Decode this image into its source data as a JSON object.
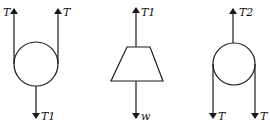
{
  "diagrams": [
    {
      "name": "pulley-upper",
      "labels": {
        "left_top": "T",
        "right_top": "T",
        "bottom": "T1"
      }
    },
    {
      "name": "weight-block",
      "labels": {
        "top": "T1",
        "bottom": "w"
      }
    },
    {
      "name": "pulley-lower",
      "labels": {
        "top": "T2",
        "left_bottom": "T",
        "right_bottom": "T"
      }
    }
  ],
  "colors": {
    "stroke": "#1a1a1a",
    "background": "#ffffff"
  }
}
